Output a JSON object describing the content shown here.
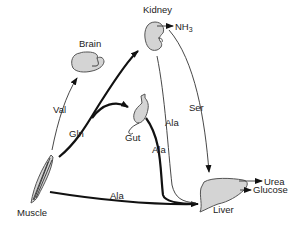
{
  "organs": {
    "kidney": "Kidney",
    "brain": "Brain",
    "gut": "Gut",
    "muscle": "Muscle",
    "liver": "Liver"
  },
  "products": {
    "nh3_main": "NH",
    "nh3_sub": "3",
    "urea": "Urea",
    "glucose": "Glucose"
  },
  "flows": {
    "val": "Val",
    "gln": "Gln",
    "ala_muscle_liver": "Ala",
    "ala_gut_liver": "Ala",
    "ala_kidney_liver": "Ala",
    "ser": "Ser"
  },
  "colors": {
    "organ_fill": "#d4d4d4",
    "stroke": "#111111"
  }
}
